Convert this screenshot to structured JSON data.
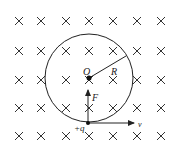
{
  "diagram": {
    "field": {
      "symbol": "×",
      "direction": "into page",
      "columns_x": [
        19,
        41,
        66,
        89,
        113,
        137,
        161
      ],
      "rows_y": [
        21,
        51,
        80,
        108,
        136
      ]
    },
    "circle": {
      "cx": 89,
      "cy": 78,
      "r": 44
    },
    "labels": {
      "center": "O",
      "radius": "R",
      "force": "F",
      "charge": "+q",
      "velocity": "v"
    },
    "colors": {
      "stroke": "#222222",
      "background": "#ffffff"
    }
  }
}
